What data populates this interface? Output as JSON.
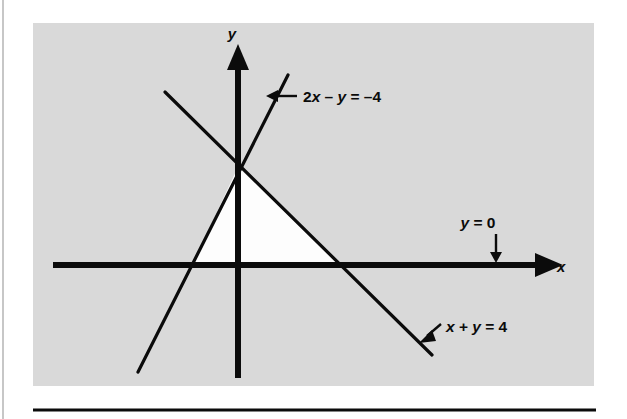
{
  "figure": {
    "background_color": "#ffffff",
    "panel_color": "#d9d9d9",
    "ink_color": "#0b0b0b",
    "region_fill": "#ffffff",
    "panel": {
      "x": 33,
      "y": 23,
      "width": 561,
      "height": 363
    },
    "axes": {
      "x_axis_label": "x",
      "y_axis_label": "y",
      "x_axis": {
        "x1": 53,
        "y": 265,
        "x2": 553
      },
      "y_axis": {
        "x": 238,
        "y1": 50,
        "y2": 378
      },
      "origin": {
        "x": 238,
        "y": 265
      }
    },
    "lines": [
      {
        "id": "line-2x-minus-y",
        "equation": "2x − y = −4",
        "equation_parts": {
          "coef": "2",
          "var1": "x",
          "op": " – ",
          "var2": "y",
          "eq": " = ",
          "value": "–4"
        },
        "x1": 138,
        "y1": 372,
        "x2": 288,
        "y2": 75,
        "x_intercept": -2,
        "y_intercept": 4,
        "slope": 2
      },
      {
        "id": "line-x-plus-y",
        "equation": "x + y = 4",
        "equation_parts": {
          "var1": "x",
          "op": " + ",
          "var2": "y",
          "eq": " = ",
          "value": "4"
        },
        "x1": 165,
        "y1": 92,
        "x2": 432,
        "y2": 355,
        "x_intercept": 4,
        "y_intercept": 4,
        "slope": -1
      },
      {
        "id": "line-y-equals-0",
        "equation": "y = 0",
        "equation_parts": {
          "var1": "y",
          "eq": " = ",
          "value": "0"
        },
        "note": "the x-axis itself"
      }
    ],
    "region": {
      "id": "feasible-region",
      "description": "shaded (white) triangular solution region",
      "vertices": [
        {
          "x": 238,
          "y": 167
        },
        {
          "x": 192,
          "y": 265
        },
        {
          "x": 340,
          "y": 265
        }
      ]
    },
    "annotations": [
      {
        "id": "annotation-2x-minus-y",
        "text": "2x – y = –4",
        "text_x": 302,
        "text_y": 101,
        "arrow": {
          "x1": 296,
          "y1": 96,
          "x2": 272,
          "y2": 96,
          "direction": "left"
        }
      },
      {
        "id": "annotation-y-equals-0",
        "text": "y = 0",
        "text_x": 480,
        "text_y": 228,
        "arrow": {
          "x1": 496,
          "y1": 236,
          "x2": 496,
          "y2": 259,
          "direction": "down"
        }
      },
      {
        "id": "annotation-x-plus-y",
        "text": "x + y = 4",
        "text_x": 444,
        "text_y": 335,
        "arrow": {
          "x1": 440,
          "y1": 325,
          "x2": 422,
          "y2": 340,
          "direction": "down-left"
        }
      }
    ],
    "rule": {
      "x1": 33,
      "y": 410,
      "x2": 596,
      "thickness": 3
    },
    "margin_line": {
      "x": 3,
      "y1": 0,
      "y2": 419
    }
  }
}
